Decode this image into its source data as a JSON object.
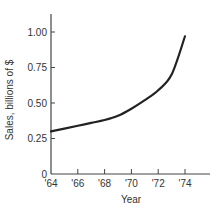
{
  "chart_data": {
    "type": "line",
    "title": "",
    "xlabel": "Year",
    "ylabel": "Sales, billions of $",
    "x_tick_labels": [
      "'64",
      "'66",
      "'68",
      "'70",
      "'72",
      "'74"
    ],
    "y_tick_labels": [
      "0",
      "0.25",
      "0.50",
      "0.75",
      "1.00"
    ],
    "ylim": [
      0,
      1.1
    ],
    "xlim": [
      1964,
      1976
    ],
    "grid": false,
    "legend": null,
    "series": [
      {
        "name": "Sales",
        "x": [
          1964,
          1965,
          1966,
          1967,
          1968,
          1969,
          1970,
          1971,
          1972,
          1973,
          1974
        ],
        "values": [
          0.3,
          0.32,
          0.34,
          0.36,
          0.38,
          0.41,
          0.46,
          0.52,
          0.59,
          0.7,
          0.97
        ]
      }
    ],
    "colors": {
      "line": "#222222",
      "axis": "#444444",
      "text": "#333333"
    }
  }
}
